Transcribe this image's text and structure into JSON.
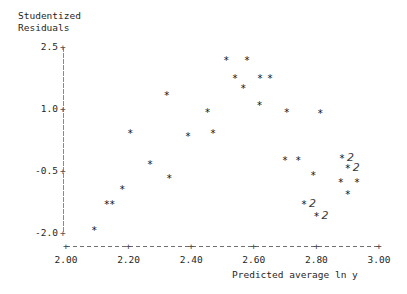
{
  "chart_data": {
    "type": "scatter",
    "title": "",
    "subtitle": "",
    "ylabel": "Studentized Residuals",
    "ylabel_line1": "Studentized",
    "ylabel_line2": "Residuals",
    "xlabel": "Predicted average ln y",
    "xlim": [
      2.0,
      3.0
    ],
    "ylim": [
      -2.0,
      2.5
    ],
    "xticks": [
      "2.00",
      "2.20",
      "2.40",
      "2.60",
      "2.80",
      "3.00"
    ],
    "xtick_values": [
      2.0,
      2.2,
      2.4,
      2.6,
      2.8,
      3.0
    ],
    "yticks": [
      "2.5",
      "1.0",
      "-0.5",
      "-2.0"
    ],
    "ytick_values": [
      2.5,
      1.0,
      -0.5,
      -2.0
    ],
    "grid": false,
    "legend": "none",
    "marker": "*",
    "overlap_label": "2",
    "points": [
      {
        "x": 2.09,
        "y": -1.95,
        "n": 1
      },
      {
        "x": 2.13,
        "y": -1.32,
        "n": 1
      },
      {
        "x": 2.148,
        "y": -1.32,
        "n": 1
      },
      {
        "x": 2.18,
        "y": -0.96,
        "n": 1
      },
      {
        "x": 2.268,
        "y": -0.35,
        "n": 1
      },
      {
        "x": 2.205,
        "y": 0.39,
        "n": 1
      },
      {
        "x": 2.33,
        "y": -0.7,
        "n": 1
      },
      {
        "x": 2.322,
        "y": 1.32,
        "n": 1
      },
      {
        "x": 2.39,
        "y": 0.33,
        "n": 1
      },
      {
        "x": 2.452,
        "y": 0.9,
        "n": 1
      },
      {
        "x": 2.47,
        "y": 0.39,
        "n": 1
      },
      {
        "x": 2.512,
        "y": 2.17,
        "n": 1
      },
      {
        "x": 2.54,
        "y": 1.72,
        "n": 1
      },
      {
        "x": 2.578,
        "y": 2.17,
        "n": 1
      },
      {
        "x": 2.566,
        "y": 1.48,
        "n": 1
      },
      {
        "x": 2.62,
        "y": 1.72,
        "n": 1
      },
      {
        "x": 2.652,
        "y": 1.72,
        "n": 1
      },
      {
        "x": 2.618,
        "y": 1.08,
        "n": 1
      },
      {
        "x": 2.705,
        "y": 0.9,
        "n": 1
      },
      {
        "x": 2.7,
        "y": -0.26,
        "n": 1
      },
      {
        "x": 2.742,
        "y": -0.26,
        "n": 1
      },
      {
        "x": 2.79,
        "y": -0.62,
        "n": 1
      },
      {
        "x": 2.76,
        "y": -1.32,
        "n": 2
      },
      {
        "x": 2.8,
        "y": -1.62,
        "n": 2
      },
      {
        "x": 2.812,
        "y": 0.88,
        "n": 1
      },
      {
        "x": 2.882,
        "y": -0.22,
        "n": 2
      },
      {
        "x": 2.9,
        "y": -0.46,
        "n": 2
      },
      {
        "x": 2.878,
        "y": -0.78,
        "n": 1
      },
      {
        "x": 2.93,
        "y": -0.78,
        "n": 1
      },
      {
        "x": 2.9,
        "y": -1.08,
        "n": 1
      }
    ]
  },
  "axis": {
    "y_label_line1": "Studentized",
    "y_label_line2": "Residuals",
    "x_label": "Predicted average ln y",
    "y_ticks": [
      {
        "label": "2.5",
        "plus": "+"
      },
      {
        "label": "1.0",
        "plus": "+"
      },
      {
        "label": "-0.5",
        "plus": "+"
      },
      {
        "label": "-2.0",
        "plus": "+"
      }
    ],
    "x_ticks": [
      {
        "label": "2.00",
        "mark": "+"
      },
      {
        "label": "2.20",
        "mark": "+"
      },
      {
        "label": "2.40",
        "mark": "+"
      },
      {
        "label": "2.60",
        "mark": "+"
      },
      {
        "label": "2.80",
        "mark": "+"
      },
      {
        "label": "3.00",
        "mark": "+"
      }
    ]
  },
  "colors": {
    "background": "#ffffff",
    "text": "#1f1f1f",
    "marker": "#101010",
    "axis": "#7a7a7a"
  }
}
